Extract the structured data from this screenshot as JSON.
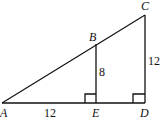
{
  "diagram": {
    "points": {
      "A": {
        "label": "A"
      },
      "B": {
        "label": "B"
      },
      "C": {
        "label": "C"
      },
      "D": {
        "label": "D"
      },
      "E": {
        "label": "E"
      }
    },
    "measures": {
      "AE": "12",
      "BE": "8",
      "CD": "12"
    },
    "right_angles": [
      "E",
      "D"
    ]
  }
}
